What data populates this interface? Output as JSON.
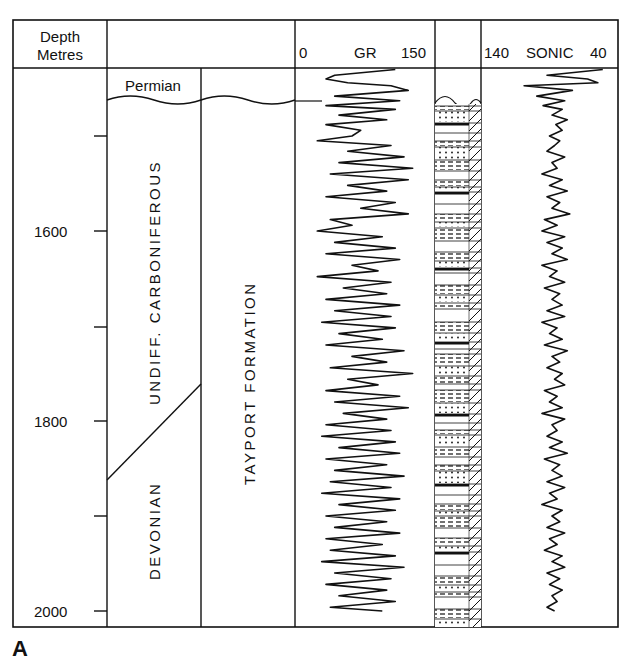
{
  "figure": {
    "panel_label": "A",
    "header": {
      "depth_label_line1": "Depth",
      "depth_label_line2": "Metres",
      "gr_min": "0",
      "gr_title": "GR",
      "gr_max": "150",
      "sonic_left": "140",
      "sonic_title": "SONIC",
      "sonic_right": "40"
    },
    "stratigraphy": {
      "permian": "Permian",
      "carboniferous": "UNDIFF. CARBONIFEROUS",
      "devonian": "DEVONIAN",
      "formation": "TAYPORT FORMATION"
    }
  },
  "chart_data": {
    "type": "line",
    "ylabel": "Depth (Metres)",
    "ylim": [
      2010,
      1420
    ],
    "y_ticks": [
      1500,
      1600,
      1700,
      1800,
      1900,
      2000
    ],
    "y_tick_labels": [
      "",
      "1600",
      "",
      "1800",
      "",
      "2000"
    ],
    "grid": false,
    "stratigraphic_units": [
      {
        "name": "Permian",
        "top": 1430,
        "base": 1445
      },
      {
        "name": "Undiff. Carboniferous",
        "top": 1445,
        "base_left": 1860,
        "base_right": 1765
      },
      {
        "name": "Devonian",
        "top_left": 1860,
        "top_right": 1765,
        "base": 2010
      },
      {
        "name": "Tayport Formation",
        "top": 1445,
        "base": 2010
      }
    ],
    "series": [
      {
        "name": "GR",
        "scale": [
          0,
          150
        ],
        "depth": [
          1430,
          1436,
          1440,
          1444,
          1447,
          1452,
          1458,
          1463,
          1468,
          1472,
          1478,
          1483,
          1488,
          1494,
          1500,
          1505,
          1510,
          1516,
          1522,
          1528,
          1534,
          1540,
          1546,
          1552,
          1558,
          1564,
          1570,
          1576,
          1582,
          1588,
          1594,
          1600,
          1606,
          1612,
          1618,
          1624,
          1630,
          1636,
          1642,
          1648,
          1654,
          1660,
          1666,
          1672,
          1678,
          1684,
          1690,
          1696,
          1702,
          1708,
          1714,
          1720,
          1726,
          1732,
          1738,
          1744,
          1750,
          1756,
          1762,
          1768,
          1774,
          1780,
          1786,
          1792,
          1798,
          1804,
          1810,
          1816,
          1822,
          1828,
          1834,
          1840,
          1846,
          1852,
          1858,
          1864,
          1870,
          1876,
          1882,
          1888,
          1894,
          1900,
          1906,
          1912,
          1918,
          1924,
          1930,
          1936,
          1942,
          1948,
          1954,
          1960,
          1966,
          1972,
          1978,
          1984,
          1990,
          1996,
          2000
        ],
        "values": [
          110,
          40,
          30,
          55,
          105,
          125,
          40,
          115,
          30,
          110,
          45,
          100,
          30,
          70,
          60,
          20,
          105,
          55,
          120,
          45,
          130,
          35,
          125,
          55,
          100,
          30,
          110,
          70,
          125,
          35,
          60,
          20,
          95,
          40,
          110,
          30,
          115,
          60,
          90,
          20,
          105,
          50,
          100,
          30,
          115,
          40,
          105,
          25,
          110,
          45,
          95,
          30,
          120,
          60,
          100,
          35,
          130,
          55,
          90,
          30,
          115,
          40,
          125,
          50,
          100,
          30,
          105,
          25,
          110,
          45,
          115,
          30,
          100,
          40,
          120,
          35,
          105,
          25,
          115,
          45,
          110,
          30,
          100,
          40,
          115,
          30,
          95,
          35,
          110,
          25,
          120,
          40,
          105,
          30,
          100,
          45,
          110,
          35,
          95
        ]
      },
      {
        "name": "SONIC",
        "scale": [
          140,
          40
        ],
        "depth": [
          1430,
          1436,
          1440,
          1444,
          1447,
          1452,
          1458,
          1463,
          1468,
          1472,
          1478,
          1483,
          1488,
          1494,
          1500,
          1505,
          1510,
          1516,
          1522,
          1528,
          1534,
          1540,
          1546,
          1552,
          1558,
          1564,
          1570,
          1576,
          1582,
          1588,
          1594,
          1600,
          1606,
          1612,
          1618,
          1624,
          1630,
          1636,
          1642,
          1648,
          1654,
          1660,
          1666,
          1672,
          1678,
          1684,
          1690,
          1696,
          1702,
          1708,
          1714,
          1720,
          1726,
          1732,
          1738,
          1744,
          1750,
          1756,
          1762,
          1768,
          1774,
          1780,
          1786,
          1792,
          1798,
          1804,
          1810,
          1816,
          1822,
          1828,
          1834,
          1840,
          1846,
          1852,
          1858,
          1864,
          1870,
          1876,
          1882,
          1888,
          1894,
          1900,
          1906,
          1912,
          1918,
          1924,
          1930,
          1936,
          1942,
          1948,
          1954,
          1960,
          1966,
          1972,
          1978,
          1984,
          1990,
          1996,
          2000
        ],
        "values": [
          48,
          92,
          60,
          52,
          110,
          72,
          100,
          78,
          95,
          80,
          88,
          76,
          85,
          80,
          90,
          82,
          86,
          92,
          78,
          88,
          84,
          96,
          80,
          90,
          76,
          92,
          82,
          88,
          74,
          94,
          84,
          96,
          78,
          92,
          80,
          88,
          76,
          96,
          84,
          90,
          78,
          94,
          82,
          88,
          80,
          92,
          78,
          96,
          84,
          90,
          80,
          94,
          76,
          88,
          82,
          92,
          80,
          86,
          78,
          94,
          84,
          90,
          80,
          96,
          78,
          88,
          84,
          92,
          80,
          90,
          76,
          94,
          82,
          88,
          80,
          92,
          78,
          90,
          84,
          96,
          80,
          88,
          82,
          92,
          78,
          90,
          84,
          94,
          80,
          88,
          78,
          92,
          82,
          90,
          80,
          88,
          84,
          92,
          86
        ]
      }
    ],
    "lithology_column": {
      "description": "Interbedded sandstone (dotted), siltstone (dashed), mudstone/coal (black) beds; diagonal hatching on right edge",
      "top": 1445,
      "base": 2010
    }
  }
}
